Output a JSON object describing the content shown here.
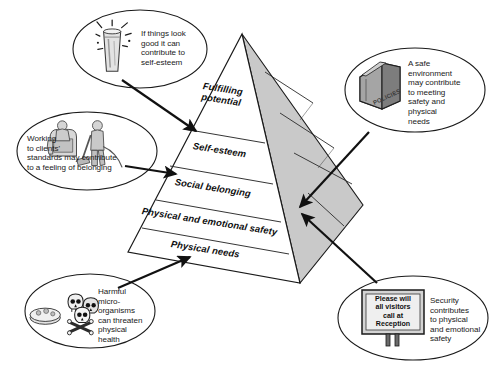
{
  "diagram": {
    "type": "pyramid-hierarchy",
    "background_color": "#ffffff",
    "pyramid": {
      "front_face_color": "#ffffff",
      "side_face_color": "#c8c8c8",
      "outline_color": "#1a1a1a",
      "tiers": [
        {
          "id": "tier-fulfilling-potential",
          "label": "Fulfilling\npotential",
          "level": 5
        },
        {
          "id": "tier-self-esteem",
          "label": "Self-esteem",
          "level": 4
        },
        {
          "id": "tier-social-belonging",
          "label": "Social belonging",
          "level": 3
        },
        {
          "id": "tier-physical-emotional-safety",
          "label": "Physical and emotional safety",
          "level": 2
        },
        {
          "id": "tier-physical-needs",
          "label": "Physical needs",
          "level": 1
        }
      ]
    },
    "callouts": [
      {
        "id": "callout-self-esteem",
        "position": "top-left",
        "icon": "sparkling-glass-icon",
        "text": "If things look\ngood it can\ncontribute to\nself-esteem",
        "points_to": "tier-self-esteem"
      },
      {
        "id": "callout-belonging",
        "position": "mid-left",
        "icon": "cleaner-vacuuming-icon",
        "text": "Working\nto clients'\nstandards may contribute\nto a feeling of belonging",
        "points_to": "tier-social-belonging"
      },
      {
        "id": "callout-physical-needs",
        "position": "bottom-left",
        "icon": "skulls-petri-dish-icon",
        "text": "Harmful\nmicro-\norganisms\ncan threaten\nphysical\nhealth",
        "points_to": "tier-physical-needs"
      },
      {
        "id": "callout-safe-environment",
        "position": "top-right",
        "icon": "policies-book-icon",
        "icon_label": "POLICIES",
        "text": "A safe\nenvironment\nmay contribute\nto meeting\nsafety and\nphysical\nneeds",
        "points_to": "tier-physical-emotional-safety"
      },
      {
        "id": "callout-security",
        "position": "bottom-right",
        "icon": "reception-sign-icon",
        "icon_label": "Please will\nall visitors\ncall at\nReception",
        "text": "Security\ncontributes\nto physical\nand emotional\nsafety",
        "points_to": "tier-physical-emotional-safety"
      }
    ]
  }
}
